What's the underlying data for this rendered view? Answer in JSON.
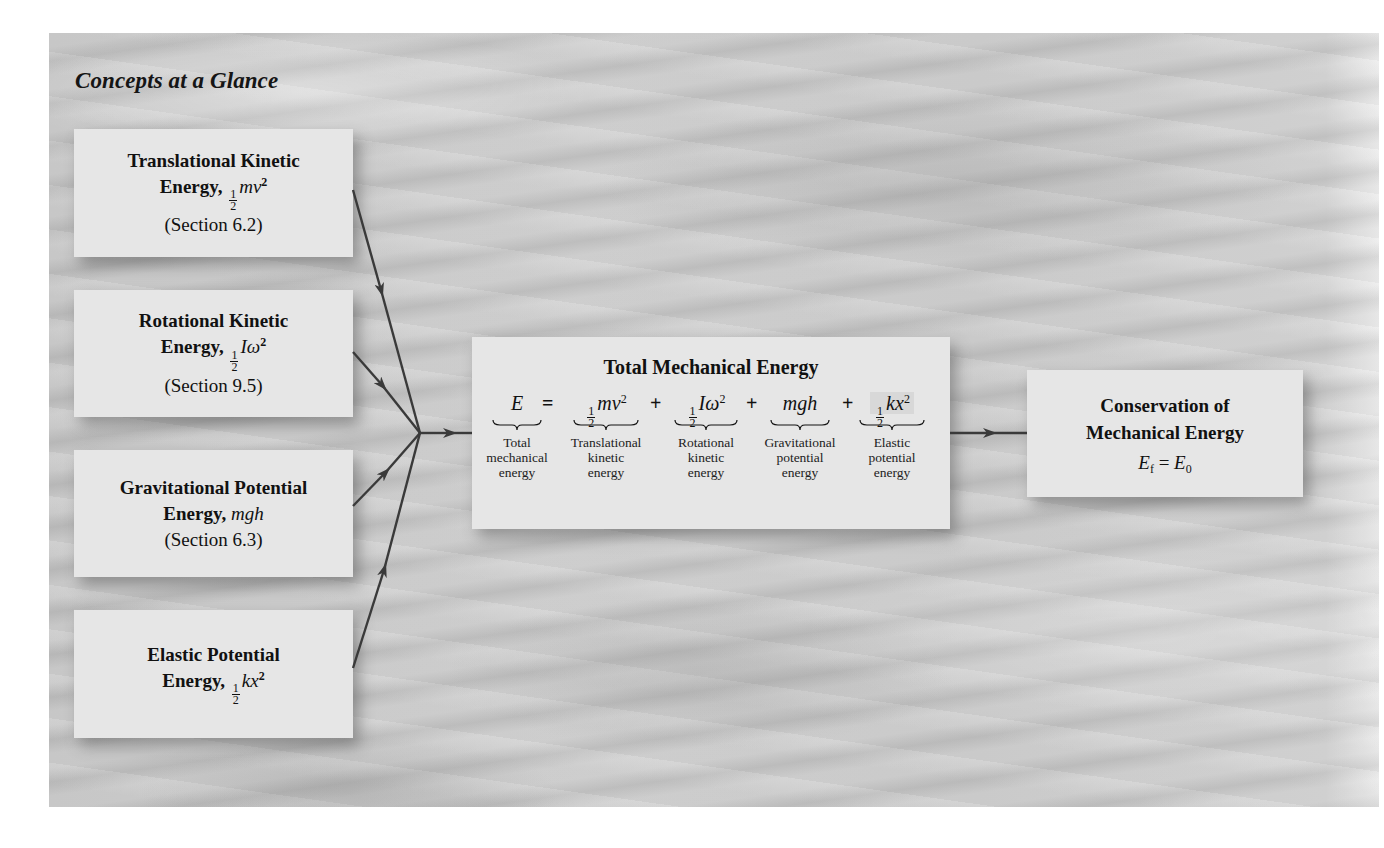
{
  "panel": {
    "title": "Concepts at a Glance"
  },
  "sources": [
    {
      "id": "trans",
      "line1": "Translational Kinetic",
      "line2_label": "Energy,",
      "frac_num": "1",
      "frac_den": "2",
      "symbol": "mv",
      "power": "2",
      "section": "(Section 6.2)"
    },
    {
      "id": "rot",
      "line1": "Rotational Kinetic",
      "line2_label": "Energy,",
      "frac_num": "1",
      "frac_den": "2",
      "symbol": "Iω",
      "power": "2",
      "section": "(Section 9.5)"
    },
    {
      "id": "grav",
      "line1": "Gravitational Potential",
      "line2_label": "Energy,",
      "symbol": "mgh",
      "section": "(Section 6.3)"
    },
    {
      "id": "elas",
      "line1": "Elastic Potential",
      "line2_label": "Energy,",
      "frac_num": "1",
      "frac_den": "2",
      "symbol": "kx",
      "power": "2"
    }
  ],
  "total": {
    "title": "Total Mechanical Energy",
    "equals": "=",
    "plus": "+",
    "terms": [
      {
        "expr": "E",
        "label": [
          "Total",
          "mechanical",
          "energy"
        ]
      },
      {
        "frac_num": "1",
        "frac_den": "2",
        "expr": "mv",
        "power": "2",
        "label": [
          "Translational",
          "kinetic",
          "energy"
        ]
      },
      {
        "frac_num": "1",
        "frac_den": "2",
        "expr": "Iω",
        "power": "2",
        "label": [
          "Rotational",
          "kinetic",
          "energy"
        ]
      },
      {
        "expr": "mgh",
        "label": [
          "Gravitational",
          "potential",
          "energy"
        ]
      },
      {
        "frac_num": "1",
        "frac_den": "2",
        "expr": "kx",
        "power": "2",
        "label": [
          "Elastic",
          "potential",
          "energy"
        ]
      }
    ]
  },
  "conservation": {
    "line1": "Conservation of",
    "line2": "Mechanical Energy",
    "lhs": "E",
    "lhs_sub": "f",
    "eq": "=",
    "rhs": "E",
    "rhs_sub": "0"
  },
  "colors": {
    "box": "#e6e6e6",
    "arrow": "#3a3a3a",
    "panel": "#cbcbcb"
  }
}
